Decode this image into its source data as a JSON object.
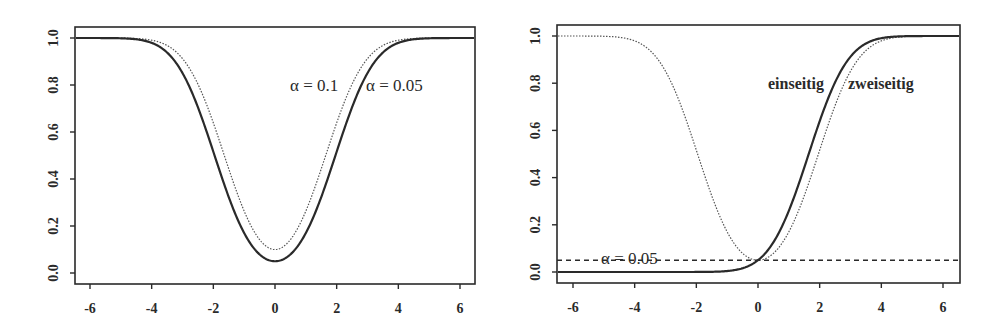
{
  "chart_data": [
    {
      "type": "line",
      "title": "",
      "xlabel": "",
      "ylabel": "",
      "xlim": [
        -6.5,
        6.5
      ],
      "ylim": [
        -0.05,
        1.05
      ],
      "x_ticks": [
        -6,
        -4,
        -2,
        0,
        2,
        4,
        6
      ],
      "x_tick_labels": [
        "-6",
        "-4",
        "-2",
        "0",
        "2",
        "4",
        "6"
      ],
      "y_ticks": [
        0.0,
        0.2,
        0.4,
        0.6,
        0.8,
        1.0
      ],
      "y_tick_labels": [
        "0.0",
        "0.2",
        "0.4",
        "0.6",
        "0.8",
        "1.0"
      ],
      "grid": false,
      "legend": "none",
      "annotations": [
        {
          "text": "α = 0.1",
          "x": 1.0,
          "y": 0.8
        },
        {
          "text": "α = 0.05",
          "x": 3.5,
          "y": 0.8
        }
      ],
      "series": [
        {
          "name": "α = 0.05",
          "style": "solid",
          "kind": "two-sided",
          "z_crit": 1.96,
          "x": [
            -6,
            -5,
            -4,
            -3,
            -2,
            -1,
            0,
            1,
            2,
            3,
            4,
            5,
            6
          ],
          "values": [
            1.0,
            0.999,
            0.979,
            0.851,
            0.516,
            0.17,
            0.05,
            0.17,
            0.516,
            0.851,
            0.979,
            0.999,
            1.0
          ]
        },
        {
          "name": "α = 0.1",
          "style": "dotted",
          "kind": "two-sided",
          "z_crit": 1.645,
          "x": [
            -6,
            -5,
            -4,
            -3,
            -2,
            -1,
            0,
            1,
            2,
            3,
            4,
            5,
            6
          ],
          "values": [
            1.0,
            1.0,
            0.991,
            0.912,
            0.639,
            0.26,
            0.1,
            0.26,
            0.639,
            0.912,
            0.991,
            1.0,
            1.0
          ]
        }
      ]
    },
    {
      "type": "line",
      "title": "",
      "xlabel": "",
      "ylabel": "",
      "xlim": [
        -6.5,
        6.5
      ],
      "ylim": [
        -0.05,
        1.05
      ],
      "x_ticks": [
        -6,
        -4,
        -2,
        0,
        2,
        4,
        6
      ],
      "x_tick_labels": [
        "-6",
        "-4",
        "-2",
        "0",
        "2",
        "4",
        "6"
      ],
      "y_ticks": [
        0.0,
        0.2,
        0.4,
        0.6,
        0.8,
        1.0
      ],
      "y_tick_labels": [
        "0.0",
        "0.2",
        "0.4",
        "0.6",
        "0.8",
        "1.0"
      ],
      "grid": false,
      "legend": "none",
      "reference_line": {
        "y": 0.05,
        "style": "dashed",
        "label": "α = 0.05"
      },
      "annotations": [
        {
          "text": "einseitig",
          "x": 1.2,
          "y": 0.8
        },
        {
          "text": "zweiseitig",
          "x": 3.8,
          "y": 0.8
        },
        {
          "text": "α = 0.05",
          "x": -4.0,
          "y": 0.07
        }
      ],
      "series": [
        {
          "name": "einseitig",
          "style": "solid",
          "kind": "one-sided",
          "z_crit": 1.645,
          "x": [
            -6,
            -5,
            -4,
            -3,
            -2,
            -1,
            0,
            1,
            2,
            3,
            4,
            5,
            6
          ],
          "values": [
            0.0,
            0.0,
            0.0,
            0.0,
            0.0,
            0.004,
            0.05,
            0.26,
            0.639,
            0.912,
            0.991,
            1.0,
            1.0
          ]
        },
        {
          "name": "zweiseitig",
          "style": "dotted",
          "kind": "two-sided",
          "z_crit": 1.96,
          "x": [
            -6,
            -5,
            -4,
            -3,
            -2,
            -1,
            0,
            1,
            2,
            3,
            4,
            5,
            6
          ],
          "values": [
            1.0,
            0.999,
            0.979,
            0.851,
            0.516,
            0.17,
            0.05,
            0.17,
            0.516,
            0.851,
            0.979,
            0.999,
            1.0
          ]
        }
      ]
    }
  ],
  "panels": [
    {
      "box": {
        "x": 75,
        "y": 27,
        "w": 400,
        "h": 257
      },
      "x_axis": {
        "px_at_min6": 90,
        "px_at_6": 460
      },
      "y_axis": {
        "px_at_0": 273,
        "px_at_1": 38
      },
      "labels": {
        "alpha_01": "α = 0.1",
        "alpha_005": "α = 0.05"
      }
    },
    {
      "box": {
        "x": 557,
        "y": 25,
        "w": 403,
        "h": 258
      },
      "x_axis": {
        "px_at_min6": 573,
        "px_at_6": 943
      },
      "y_axis": {
        "px_at_0": 272,
        "px_at_1": 36
      },
      "labels": {
        "einseitig": "einseitig",
        "zweiseitig": "zweiseitig",
        "alpha_ref": "α = 0.05"
      }
    }
  ],
  "colors": {
    "ink": "#2a2a2a",
    "dotted": "#555555",
    "background": "#ffffff"
  }
}
